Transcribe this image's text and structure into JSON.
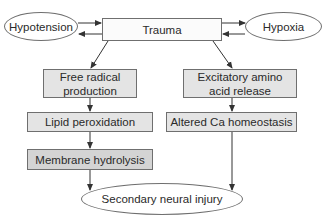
{
  "diagram": {
    "type": "flowchart",
    "nodes": {
      "hypotension": {
        "label": "Hypotension",
        "shape": "ellipse"
      },
      "trauma": {
        "label": "Trauma",
        "shape": "box"
      },
      "hypoxia": {
        "label": "Hypoxia",
        "shape": "ellipse"
      },
      "free_radical": {
        "label": "Free radical production",
        "shape": "box"
      },
      "lipid_peroxidation": {
        "label": "Lipid peroxidation",
        "shape": "box"
      },
      "membrane_hydrolysis": {
        "label": "Membrane hydrolysis",
        "shape": "box"
      },
      "excitatory": {
        "label": "Excitatory amino acid release",
        "shape": "box"
      },
      "altered_ca": {
        "label": "Altered Ca homeostasis",
        "shape": "box"
      },
      "secondary_injury": {
        "label": "Secondary neural injury",
        "shape": "ellipse"
      }
    },
    "edges": [
      {
        "from": "hypotension",
        "to": "trauma"
      },
      {
        "from": "trauma",
        "to": "hypotension"
      },
      {
        "from": "hypoxia",
        "to": "trauma"
      },
      {
        "from": "trauma",
        "to": "hypoxia"
      },
      {
        "from": "trauma",
        "to": "free_radical"
      },
      {
        "from": "trauma",
        "to": "excitatory"
      },
      {
        "from": "free_radical",
        "to": "lipid_peroxidation"
      },
      {
        "from": "lipid_peroxidation",
        "to": "membrane_hydrolysis"
      },
      {
        "from": "membrane_hydrolysis",
        "to": "secondary_injury"
      },
      {
        "from": "excitatory",
        "to": "altered_ca"
      },
      {
        "from": "altered_ca",
        "to": "secondary_injury"
      }
    ]
  },
  "colors": {
    "line": "#333333",
    "border": "#6f6f6f",
    "box_white": "#fbfbfb",
    "box_light": "#e4e4e4",
    "box_mid": "#d4d4d4"
  }
}
